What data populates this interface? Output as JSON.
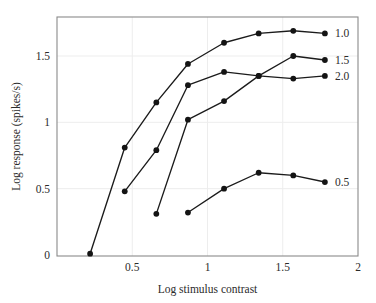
{
  "chart_data": {
    "type": "line",
    "title": "",
    "xlabel": "Log stimulus contrast",
    "ylabel": "Log response (spikes/s)",
    "xlim": [
      0,
      2
    ],
    "ylim": [
      0,
      1.8
    ],
    "grid": true,
    "legend_position": "right-of-plot-end-labels",
    "xticks": [
      0.5,
      1,
      1.5,
      2
    ],
    "xtick_labels": [
      "0.5",
      "1",
      "1.5",
      "2"
    ],
    "yticks": [
      0,
      0.5,
      1,
      1.5
    ],
    "ytick_labels": [
      "0",
      "0.5",
      "1",
      "1.5"
    ],
    "series": [
      {
        "name": "1.0",
        "label": "1.0",
        "x": [
          0.22,
          0.45,
          0.66,
          0.87,
          1.11,
          1.34,
          1.57,
          1.78
        ],
        "values": [
          0.01,
          0.81,
          1.15,
          1.44,
          1.6,
          1.67,
          1.69,
          1.67
        ]
      },
      {
        "name": "2.0",
        "label": "2.0",
        "x": [
          0.45,
          0.66,
          0.87,
          1.11,
          1.34,
          1.57,
          1.78
        ],
        "values": [
          0.48,
          0.79,
          1.28,
          1.38,
          1.35,
          1.33,
          1.35
        ]
      },
      {
        "name": "1.5",
        "label": "1.5",
        "x": [
          0.66,
          0.87,
          1.11,
          1.34,
          1.57,
          1.78
        ],
        "values": [
          0.31,
          1.02,
          1.16,
          1.35,
          1.5,
          1.47
        ]
      },
      {
        "name": "0.5",
        "label": "0.5",
        "x": [
          0.87,
          1.11,
          1.34,
          1.57,
          1.78
        ],
        "values": [
          0.32,
          0.5,
          0.62,
          0.6,
          0.55
        ]
      }
    ]
  },
  "axes": {
    "x_title": "Log stimulus contrast",
    "y_title": "Log response (spikes/s)"
  },
  "colors": {
    "line": "#1b1b1b",
    "marker": "#141414",
    "frame": "#8a8a8a",
    "grid": "#ededed",
    "text": "#2b2b2b",
    "background": "#ffffff"
  }
}
